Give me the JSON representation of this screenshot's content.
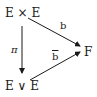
{
  "diagram": {
    "type": "commutative-triangle",
    "nodes": {
      "top_left": "E × E",
      "bottom_left": "E ∨ E",
      "right": "F"
    },
    "arrows": [
      {
        "from": "top_left",
        "to": "bottom_left",
        "label": "π"
      },
      {
        "from": "top_left",
        "to": "right",
        "label": "b"
      },
      {
        "from": "bottom_left",
        "to": "right",
        "label": "b"
      }
    ],
    "labels": {
      "pi": "π",
      "b": "b",
      "b_bar": "b"
    }
  }
}
